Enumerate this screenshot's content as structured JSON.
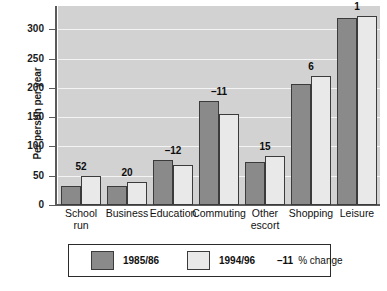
{
  "chart_data": {
    "type": "bar",
    "title": "",
    "xlabel": "",
    "ylabel": "Per person per year",
    "ylim": [
      0,
      340
    ],
    "yticks": [
      0,
      50,
      100,
      150,
      200,
      250,
      300
    ],
    "ytick_labels": [
      "0",
      "50",
      "100",
      "150",
      "200",
      "250",
      "300"
    ],
    "grid": true,
    "legend_position": "bottom",
    "categories": [
      "School run",
      "Business",
      "Education",
      "Commuting",
      "Other escort",
      "Shopping",
      "Leisure"
    ],
    "category_label_lines": [
      [
        "School",
        "run"
      ],
      [
        "Business"
      ],
      [
        "Education"
      ],
      [
        "Commuting"
      ],
      [
        "Other",
        "escort"
      ],
      [
        "Shopping"
      ],
      [
        "Leisure"
      ]
    ],
    "series": [
      {
        "name": "1985/86",
        "color": "#8a8a8a",
        "values": [
          33,
          32,
          77,
          178,
          73,
          207,
          320
        ]
      },
      {
        "name": "1994/96",
        "color": "#e9e9e9",
        "values": [
          50,
          40,
          68,
          156,
          84,
          220,
          323
        ]
      }
    ],
    "annotations": {
      "label": "% change",
      "values": [
        "52",
        "20",
        "–12",
        "–11",
        "15",
        "6",
        "1"
      ]
    },
    "legend": {
      "entries": [
        {
          "label": "1985/86",
          "color": "#8a8a8a"
        },
        {
          "label": "1994/96",
          "color": "#e9e9e9"
        }
      ],
      "note_value": "–11",
      "note_text": "% change"
    },
    "colors": {
      "plot_background": "#d2d2d2",
      "gridline": "#f4f4f4",
      "axis": "#5a5a5a",
      "bar_border": "#3b3b3b",
      "text": "#111111"
    }
  }
}
